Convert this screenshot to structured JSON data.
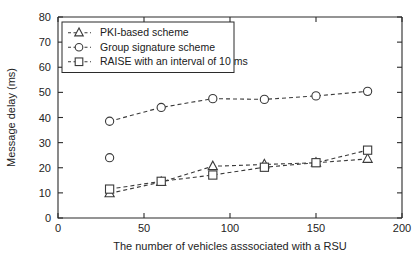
{
  "chart_data": {
    "type": "line",
    "title": "",
    "xlabel": "The number of vehicles asssociated with a RSU",
    "ylabel": "Message delay (ms)",
    "xlim": [
      0,
      200
    ],
    "ylim": [
      0,
      80
    ],
    "xticks": [
      0,
      50,
      100,
      150,
      200
    ],
    "yticks": [
      0,
      10,
      20,
      30,
      40,
      50,
      60,
      70,
      80
    ],
    "xticklabels": [
      "0",
      "50",
      "100",
      "150",
      "200"
    ],
    "yticklabels": [
      "0",
      "10",
      "20",
      "30",
      "40",
      "50",
      "60",
      "70",
      "80"
    ],
    "grid": false,
    "legend_position": "upper left",
    "x": [
      30,
      60,
      90,
      120,
      150,
      180
    ],
    "series": [
      {
        "name": "PKI-based scheme",
        "marker": "triangle",
        "linestyle": "dashed",
        "values": [
          9.8,
          14.3,
          20.6,
          21.3,
          22.0,
          23.5
        ]
      },
      {
        "name": "Group signature scheme",
        "marker": "circle",
        "linestyle": "dashed",
        "values": [
          38.5,
          44.0,
          47.5,
          47.2,
          48.6,
          50.4
        ],
        "extra_points": [
          {
            "x": 30,
            "y": 24.0,
            "connected": false
          }
        ]
      },
      {
        "name": "RAISE with an interval of 10 ms",
        "marker": "square",
        "linestyle": "dashed",
        "values": [
          11.5,
          14.6,
          17.1,
          20.2,
          22.0,
          27.0
        ]
      }
    ]
  },
  "legend": {
    "entries": [
      {
        "label": "PKI-based scheme",
        "marker": "triangle-icon"
      },
      {
        "label": "Group signature scheme",
        "marker": "circle-icon"
      },
      {
        "label": "RAISE with an interval of 10 ms",
        "marker": "square-icon"
      }
    ]
  },
  "colors": {
    "axis": "#2b2b2b",
    "series": "#3a3a3a",
    "background": "#ffffff"
  }
}
